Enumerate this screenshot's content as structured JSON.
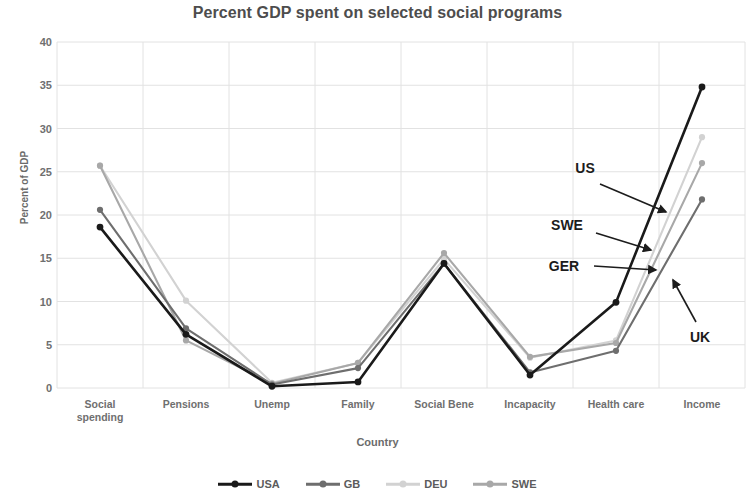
{
  "chart_data": {
    "type": "line",
    "title": "Percent GDP spent on selected social programs",
    "xlabel": "Country",
    "ylabel": "Percent of GDP",
    "ylim": [
      0,
      40
    ],
    "ytick_step": 5,
    "yticks": [
      0,
      5,
      10,
      15,
      20,
      25,
      30,
      35,
      40
    ],
    "grid": true,
    "legend_position": "bottom",
    "categories": [
      "Social\nspending",
      "Pensions",
      "Unemp",
      "Family",
      "Social Bene",
      "Incapacity",
      "Health care",
      "Income"
    ],
    "series": [
      {
        "name": "USA",
        "color": "#1a1a1a",
        "values": [
          18.6,
          6.2,
          0.2,
          0.7,
          14.4,
          1.5,
          9.9,
          34.8
        ]
      },
      {
        "name": "GB",
        "color": "#6e6e6e",
        "values": [
          20.6,
          6.9,
          0.4,
          2.3,
          14.4,
          1.8,
          4.3,
          21.8
        ]
      },
      {
        "name": "DEU",
        "color": "#d2d2d2",
        "values": [
          25.7,
          10.1,
          0.6,
          2.9,
          14.9,
          3.5,
          5.5,
          29.0
        ]
      },
      {
        "name": "SWE",
        "color": "#a8a8a8",
        "values": [
          25.7,
          5.5,
          0.5,
          2.9,
          15.6,
          3.6,
          5.2,
          26.0
        ]
      }
    ],
    "annotations": [
      {
        "text": "US",
        "label_x": 585,
        "label_y": 168,
        "arrow_from_x": 600,
        "arrow_from_y": 184,
        "arrow_to_x": 666,
        "arrow_to_y": 212
      },
      {
        "text": "SWE",
        "label_x": 567,
        "label_y": 225,
        "arrow_from_x": 596,
        "arrow_from_y": 233,
        "arrow_to_x": 651,
        "arrow_to_y": 250
      },
      {
        "text": "GER",
        "label_x": 564,
        "label_y": 266,
        "arrow_from_x": 594,
        "arrow_from_y": 266,
        "arrow_to_x": 656,
        "arrow_to_y": 270
      },
      {
        "text": "UK",
        "label_x": 700,
        "label_y": 337,
        "arrow_from_x": 696,
        "arrow_from_y": 322,
        "arrow_to_x": 673,
        "arrow_to_y": 280
      }
    ],
    "plot_area": {
      "left": 57,
      "right": 745,
      "top": 42,
      "bottom": 388
    },
    "style": {
      "grid_color": "#e2e2e2",
      "axis_label_color": "#6f6f6f",
      "title_color": "#4d4d4d",
      "background": "#ffffff"
    }
  }
}
